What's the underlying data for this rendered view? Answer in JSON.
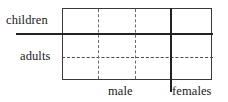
{
  "figure": {
    "type": "partition-diagram",
    "title": "",
    "labels": {
      "children": "children",
      "adults": "adults",
      "male": "male",
      "females": "females"
    },
    "colors": {
      "ink": "#222222",
      "frame": "#3a3a3a",
      "dashed": "#4a4a4a",
      "background": "#ffffff"
    },
    "dividers": {
      "children_adults": {
        "orientation": "horizontal",
        "style": "solid",
        "label": "children"
      },
      "adults_inner": {
        "orientation": "horizontal",
        "style": "dashed",
        "label": "adults"
      },
      "male_females": {
        "orientation": "vertical",
        "style": "solid",
        "label": "females"
      },
      "male_inner_1": {
        "orientation": "vertical",
        "style": "dashed",
        "label": ""
      },
      "male_inner_2": {
        "orientation": "vertical",
        "style": "dashed",
        "label": ""
      }
    }
  }
}
